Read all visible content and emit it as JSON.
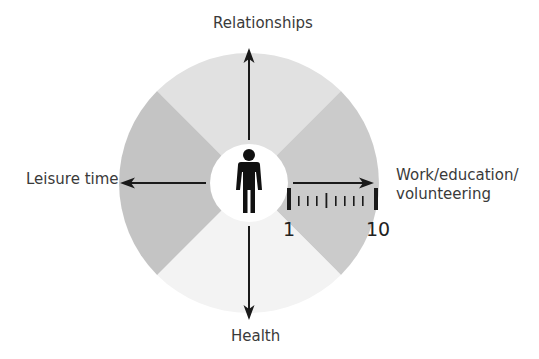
{
  "diagram": {
    "type": "life-domains-wheel",
    "center_icon": "person-icon",
    "domains": {
      "top": "Relationships",
      "left": "Leisure time",
      "right_line1": "Work/education/",
      "right_line2": "volunteering",
      "bottom": "Health"
    },
    "scale": {
      "min": "1",
      "max": "10",
      "ticks": 10
    },
    "colors": {
      "top_sector": "#e1e1e1",
      "right_sector": "#cbcbcb",
      "bottom_sector": "#f3f3f3",
      "left_sector": "#c4c4c4",
      "center": "#ffffff",
      "ink": "#1a1a1a"
    }
  }
}
